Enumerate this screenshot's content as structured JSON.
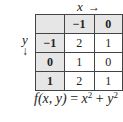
{
  "axis_labels": {
    "x": "x",
    "x_arrow": "→",
    "y": "y",
    "y_arrow": "↓"
  },
  "table": {
    "corner": "",
    "column_headers": [
      "−1",
      "0"
    ],
    "rows": [
      {
        "header": "−1",
        "values": [
          "2",
          "1"
        ]
      },
      {
        "header": "0",
        "values": [
          "1",
          "0"
        ]
      },
      {
        "header": "1",
        "values": [
          "2",
          "1"
        ]
      }
    ]
  },
  "formula": {
    "lhs": "f(x, y)",
    "equals": " = ",
    "term1": "x",
    "exp1": "2",
    "plus": " + ",
    "term2": "y",
    "exp2": "2"
  }
}
